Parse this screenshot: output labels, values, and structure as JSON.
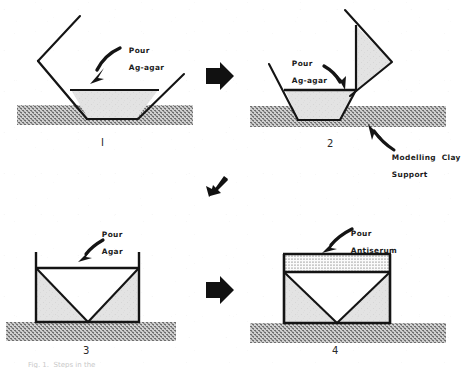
{
  "figure": {
    "background_color": "#ffffff",
    "ink_color": "#141414",
    "agar_fill_color": "#e2e2e2",
    "antiserum_fill_color": "#f2f2f2",
    "clay_fill_color": "#9a9a9a"
  },
  "panels": [
    {
      "id": "panel-1",
      "number": "I",
      "pour_label": "Pour\nAg-agar",
      "pour_label_line1": "Pour",
      "pour_label_line2": "Ag-agar"
    },
    {
      "id": "panel-2",
      "number": "2",
      "pour_label": "Pour\nAg-agar",
      "pour_label_line1": "Pour",
      "pour_label_line2": "Ag-agar",
      "support_label": "Modelling  Clay\nSupport",
      "support_label_line1": "Modelling  Clay",
      "support_label_line2": "Support"
    },
    {
      "id": "panel-3",
      "number": "3",
      "pour_label": "Pour\nAgar",
      "pour_label_line1": "Pour",
      "pour_label_line2": "Agar"
    },
    {
      "id": "panel-4",
      "number": "4",
      "pour_label": "Pour\nAntiserum",
      "pour_label_line1": "Pour",
      "pour_label_line2": "Antiserum"
    }
  ],
  "flow_arrows": [
    {
      "id": "arrow-1-to-2",
      "direction": "right"
    },
    {
      "id": "arrow-2-to-3",
      "direction": "down-left"
    },
    {
      "id": "arrow-3-to-4",
      "direction": "right"
    }
  ],
  "caption": {
    "clipped_text": "Fig. 1.  Steps in the"
  }
}
